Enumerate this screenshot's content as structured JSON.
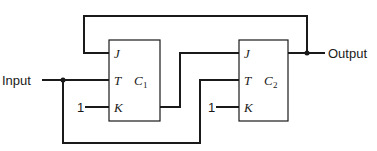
{
  "diagram": {
    "input_label": "Input",
    "output_label": "Output",
    "flipflops": [
      {
        "name": "C",
        "sub": "1",
        "pins": {
          "j": "J",
          "t": "T",
          "k": "K"
        },
        "k_input": "1"
      },
      {
        "name": "C",
        "sub": "2",
        "pins": {
          "j": "J",
          "t": "T",
          "k": "K"
        },
        "k_input": "1"
      }
    ]
  }
}
